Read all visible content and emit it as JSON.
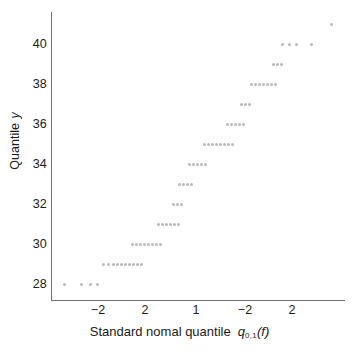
{
  "figure": {
    "width": 359,
    "height": 352,
    "background": "#ffffff",
    "marker_color": "#b9b9b9",
    "axis_color": "#6f6f6f",
    "text_color": "#1a1a1a"
  },
  "axes": {
    "ylabel_text": "Quantile ",
    "ylabel_symbol": "y",
    "xlabel_text": "Standard nomal quantile",
    "xlabel_symbol": "q",
    "xlabel_subscript": "0,1",
    "xlabel_suffix": "(f)",
    "yticks": [
      "28",
      "30",
      "32",
      "34",
      "36",
      "38",
      "40"
    ],
    "xticks": [
      "−2",
      "2",
      "1",
      "−2",
      "2"
    ]
  },
  "chart_data": {
    "type": "scatter",
    "title": "",
    "xlabel": "Standard nomal quantile q0,1(f)",
    "ylabel": "Quantile y",
    "xtick_labels": [
      "−2",
      "2",
      "1",
      "−2",
      "2"
    ],
    "xtick_pixels": [
      98,
      145,
      196,
      245,
      292
    ],
    "ytick_values": [
      28,
      30,
      32,
      34,
      36,
      38,
      40
    ],
    "ylim": [
      27.2,
      41.6
    ],
    "grid": false,
    "legend": null,
    "note": "Normal quantile-quantile plot; observations are integer-valued so points form horizontal runs at each integer y.",
    "points": [
      {
        "x_px": 63,
        "y": 28
      },
      {
        "x_px": 80,
        "y": 28
      },
      {
        "x_px": 89,
        "y": 28
      },
      {
        "x_px": 96,
        "y": 28
      },
      {
        "x_px": 102,
        "y": 29
      },
      {
        "x_px": 107,
        "y": 29
      },
      {
        "x_px": 112,
        "y": 29
      },
      {
        "x_px": 116,
        "y": 29
      },
      {
        "x_px": 120,
        "y": 29
      },
      {
        "x_px": 124,
        "y": 29
      },
      {
        "x_px": 128,
        "y": 29
      },
      {
        "x_px": 132,
        "y": 29
      },
      {
        "x_px": 136,
        "y": 29
      },
      {
        "x_px": 140,
        "y": 29
      },
      {
        "x_px": 131,
        "y": 30
      },
      {
        "x_px": 135,
        "y": 30
      },
      {
        "x_px": 139,
        "y": 30
      },
      {
        "x_px": 143,
        "y": 30
      },
      {
        "x_px": 147,
        "y": 30
      },
      {
        "x_px": 151,
        "y": 30
      },
      {
        "x_px": 155,
        "y": 30
      },
      {
        "x_px": 159,
        "y": 30
      },
      {
        "x_px": 157,
        "y": 31
      },
      {
        "x_px": 161,
        "y": 31
      },
      {
        "x_px": 165,
        "y": 31
      },
      {
        "x_px": 169,
        "y": 31
      },
      {
        "x_px": 173,
        "y": 31
      },
      {
        "x_px": 177,
        "y": 31
      },
      {
        "x_px": 172,
        "y": 32
      },
      {
        "x_px": 176,
        "y": 32
      },
      {
        "x_px": 180,
        "y": 32
      },
      {
        "x_px": 178,
        "y": 33
      },
      {
        "x_px": 182,
        "y": 33
      },
      {
        "x_px": 186,
        "y": 33
      },
      {
        "x_px": 190,
        "y": 33
      },
      {
        "x_px": 188,
        "y": 34
      },
      {
        "x_px": 192,
        "y": 34
      },
      {
        "x_px": 196,
        "y": 34
      },
      {
        "x_px": 200,
        "y": 34
      },
      {
        "x_px": 204,
        "y": 34
      },
      {
        "x_px": 203,
        "y": 35
      },
      {
        "x_px": 207,
        "y": 35
      },
      {
        "x_px": 211,
        "y": 35
      },
      {
        "x_px": 215,
        "y": 35
      },
      {
        "x_px": 219,
        "y": 35
      },
      {
        "x_px": 223,
        "y": 35
      },
      {
        "x_px": 227,
        "y": 35
      },
      {
        "x_px": 231,
        "y": 35
      },
      {
        "x_px": 226,
        "y": 36
      },
      {
        "x_px": 230,
        "y": 36
      },
      {
        "x_px": 234,
        "y": 36
      },
      {
        "x_px": 238,
        "y": 36
      },
      {
        "x_px": 242,
        "y": 36
      },
      {
        "x_px": 240,
        "y": 37
      },
      {
        "x_px": 244,
        "y": 37
      },
      {
        "x_px": 248,
        "y": 37
      },
      {
        "x_px": 250,
        "y": 38
      },
      {
        "x_px": 254,
        "y": 38
      },
      {
        "x_px": 258,
        "y": 38
      },
      {
        "x_px": 262,
        "y": 38
      },
      {
        "x_px": 266,
        "y": 38
      },
      {
        "x_px": 270,
        "y": 38
      },
      {
        "x_px": 274,
        "y": 38
      },
      {
        "x_px": 272,
        "y": 39
      },
      {
        "x_px": 276,
        "y": 39
      },
      {
        "x_px": 280,
        "y": 39
      },
      {
        "x_px": 281,
        "y": 40
      },
      {
        "x_px": 288,
        "y": 40
      },
      {
        "x_px": 295,
        "y": 40
      },
      {
        "x_px": 310,
        "y": 40
      },
      {
        "x_px": 330,
        "y": 41
      }
    ]
  }
}
